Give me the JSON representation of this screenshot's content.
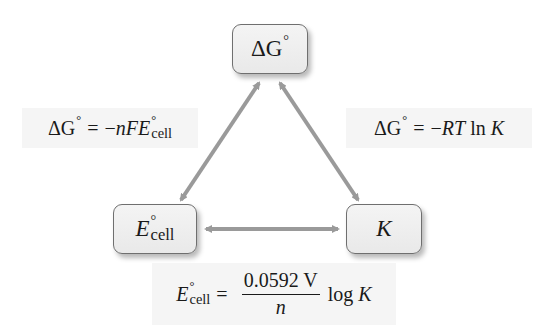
{
  "diagram": {
    "nodes": {
      "top": {
        "symbol": "ΔG",
        "superscript": "°"
      },
      "left": {
        "symbol": "E",
        "superscript": "°",
        "subscript": "cell"
      },
      "right": {
        "symbol": "K"
      }
    },
    "edges": {
      "left_edge": {
        "from": "ΔG°",
        "to": "E°cell",
        "bidirectional": true,
        "equation": {
          "lhs": "ΔG",
          "lhs_sup": "°",
          "eq": "=",
          "rhs_prefix": "−",
          "rhs_vars": "nFE",
          "rhs_sup": "°",
          "rhs_sub": "cell"
        }
      },
      "right_edge": {
        "from": "ΔG°",
        "to": "K",
        "bidirectional": true,
        "equation": {
          "lhs": "ΔG",
          "lhs_sup": "°",
          "eq": "=",
          "rhs_prefix": "−",
          "rhs_vars": "RT",
          "rhs_fn": "ln",
          "rhs_var2": "K"
        }
      },
      "bottom_edge": {
        "from": "E°cell",
        "to": "K",
        "bidirectional": true,
        "equation": {
          "lhs": "E",
          "lhs_sup": "°",
          "lhs_sub": "cell",
          "eq": "=",
          "numerator": "0.0592 V",
          "denominator": "n",
          "fn": "log",
          "var": "K"
        }
      }
    },
    "colors": {
      "arrow": "#9a9a9a",
      "node_fill": "#efefef",
      "node_border": "#6f6f6f",
      "label_bg": "#f5f5f5",
      "text": "#1a1a1a"
    }
  }
}
